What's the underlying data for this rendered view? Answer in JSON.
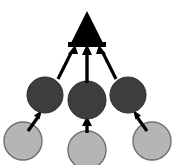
{
  "figure": {
    "title": "",
    "width": 174,
    "height": 165,
    "background_color": "#ffffff"
  },
  "chart_data": {
    "type": "diagram",
    "title": "",
    "layout": "bottom-up convergent tree",
    "colors": {
      "triangle_fill": "#000000",
      "dark_circle_fill": "#3d3d3d",
      "dark_circle_stroke": "#2a2a2a",
      "light_circle_fill": "#b5b5b5",
      "light_circle_stroke": "#6e6e6e",
      "arrow_color": "#000000",
      "background": "#ffffff"
    },
    "nodes": [
      {
        "id": "root-triangle",
        "shape": "triangle",
        "fill": "#000000",
        "cx": 87,
        "cy": 29,
        "width": 36,
        "height": 36,
        "label": "",
        "row": "top"
      },
      {
        "id": "mid-left-circle",
        "shape": "circle",
        "fill": "#3d3d3d",
        "cx": 45,
        "cy": 95,
        "r": 18,
        "label": "",
        "row": "middle"
      },
      {
        "id": "mid-center-circle",
        "shape": "circle",
        "fill": "#3d3d3d",
        "cx": 87,
        "cy": 100,
        "r": 19,
        "label": "",
        "row": "middle"
      },
      {
        "id": "mid-right-circle",
        "shape": "circle",
        "fill": "#3d3d3d",
        "cx": 128,
        "cy": 95,
        "r": 18,
        "label": "",
        "row": "middle"
      },
      {
        "id": "leaf-left-circle",
        "shape": "circle",
        "fill": "#b5b5b5",
        "cx": 23,
        "cy": 141,
        "r": 19,
        "label": "",
        "row": "bottom"
      },
      {
        "id": "leaf-center-circle",
        "shape": "circle",
        "fill": "#b5b5b5",
        "cx": 87,
        "cy": 150,
        "r": 19,
        "label": "",
        "row": "bottom"
      },
      {
        "id": "leaf-right-circle",
        "shape": "circle",
        "fill": "#b5b5b5",
        "cx": 152,
        "cy": 141,
        "r": 19,
        "label": "",
        "row": "bottom"
      }
    ],
    "edges": [
      {
        "id": "edge-mid-left-to-root",
        "from": "mid-left-circle",
        "to": "root-triangle",
        "direction": "up-right",
        "arrowhead": "to"
      },
      {
        "id": "edge-mid-center-to-root",
        "from": "mid-center-circle",
        "to": "root-triangle",
        "direction": "up",
        "arrowhead": "to"
      },
      {
        "id": "edge-mid-right-to-root",
        "from": "mid-right-circle",
        "to": "root-triangle",
        "direction": "up-left",
        "arrowhead": "to"
      },
      {
        "id": "edge-leaf-left-to-mid-left",
        "from": "leaf-left-circle",
        "to": "mid-left-circle",
        "direction": "up-right",
        "arrowhead": "to"
      },
      {
        "id": "edge-leaf-center-to-mid-center",
        "from": "leaf-center-circle",
        "to": "mid-center-circle",
        "direction": "up",
        "arrowhead": "to"
      },
      {
        "id": "edge-leaf-right-to-mid-right",
        "from": "leaf-right-circle",
        "to": "mid-right-circle",
        "direction": "up-left",
        "arrowhead": "to"
      }
    ]
  }
}
